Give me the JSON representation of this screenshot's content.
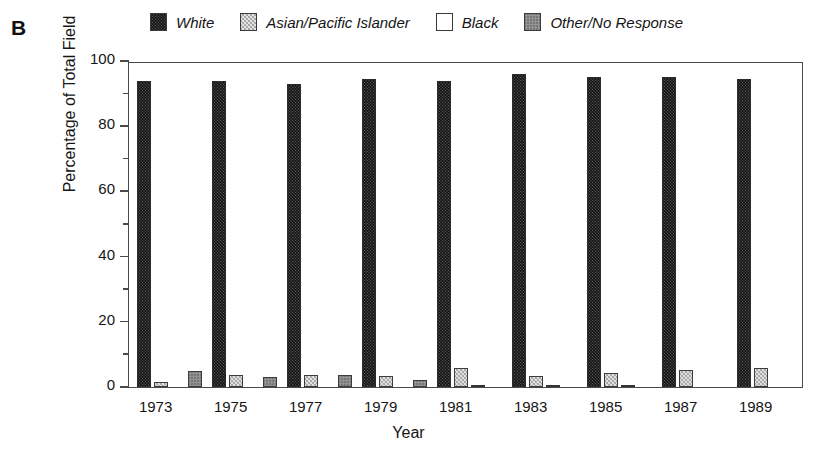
{
  "panel": {
    "label": "B"
  },
  "legend": {
    "position": "top",
    "items": [
      {
        "label": "White",
        "swatch": "dark-hatch-swatch",
        "color": "#5a5a5a"
      },
      {
        "label": "Asian/Pacific Islander",
        "swatch": "light-hatch-swatch",
        "color": "#e0e0e0"
      },
      {
        "label": "Black",
        "swatch": "empty-swatch",
        "color": "#ffffff"
      },
      {
        "label": "Other/No Response",
        "swatch": "gray-hatch-swatch",
        "color": "#949494"
      }
    ]
  },
  "axes": {
    "y": {
      "title": "Percentage of Total Field",
      "ticks": [
        0,
        20,
        40,
        60,
        80,
        100
      ],
      "minor_ticks": [
        10,
        30,
        50,
        70,
        90
      ],
      "min": 0,
      "max": 100
    },
    "x": {
      "title": "Year",
      "ticks": [
        "1973",
        "1975",
        "1977",
        "1979",
        "1981",
        "1983",
        "1985",
        "1987",
        "1989"
      ]
    }
  },
  "chart_data": {
    "type": "bar",
    "title": "B",
    "xlabel": "Year",
    "ylabel": "Percentage of Total Field",
    "ylim": [
      0,
      100
    ],
    "grid": false,
    "legend_position": "top",
    "categories": [
      "1973",
      "1975",
      "1977",
      "1979",
      "1981",
      "1983",
      "1985",
      "1987",
      "1989"
    ],
    "series": [
      {
        "name": "White",
        "color": "#5a5a5a",
        "values": [
          94.0,
          94.0,
          93.0,
          94.5,
          94.0,
          96.0,
          95.2,
          95.0,
          94.5
        ]
      },
      {
        "name": "Asian/Pacific Islander",
        "color": "#e0e0e0",
        "values": [
          1.4,
          3.8,
          3.8,
          3.5,
          5.8,
          3.5,
          4.4,
          5.2,
          5.8
        ]
      },
      {
        "name": "Black",
        "color": "#ffffff",
        "values": [
          0.0,
          0.0,
          0.0,
          0.0,
          0.6,
          0.7,
          0.6,
          0.0,
          0.0
        ]
      },
      {
        "name": "Other/No Response",
        "color": "#949494",
        "values": [
          4.8,
          3.0,
          3.6,
          2.2,
          0.0,
          0.0,
          0.0,
          0.0,
          0.0
        ]
      }
    ]
  }
}
